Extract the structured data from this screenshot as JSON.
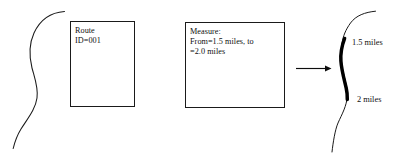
{
  "diagram": {
    "background_color": "#ffffff",
    "line_color": "#1a1a1a",
    "highlight_color": "#000000",
    "text_color": "#101010"
  },
  "boxes": [
    {
      "id": "route-box",
      "name": "route-attribute-box",
      "text": "Route\nID=001"
    },
    {
      "id": "measure-box",
      "name": "measure-attribute-box",
      "text": "Measure:\nFrom=1.5 miles, to\n=2.0 miles"
    }
  ],
  "shapes": {
    "input_route_line": {
      "name": "input-route-polyline",
      "description": "S-shaped route line on the left"
    },
    "output_route_line": {
      "name": "output-route-polyline",
      "description": "S-shaped route line on the right with highlighted measured segment"
    },
    "highlighted_segment": {
      "name": "highlighted-measure-segment",
      "description": "Thick black portion of the right route between 1.5 and 2 miles"
    },
    "arrow": {
      "name": "process-arrow",
      "description": "Arrow pointing right from the measure box to the output route"
    }
  },
  "labels": {
    "from_measure": "1.5 miles",
    "to_measure": "2 miles"
  }
}
